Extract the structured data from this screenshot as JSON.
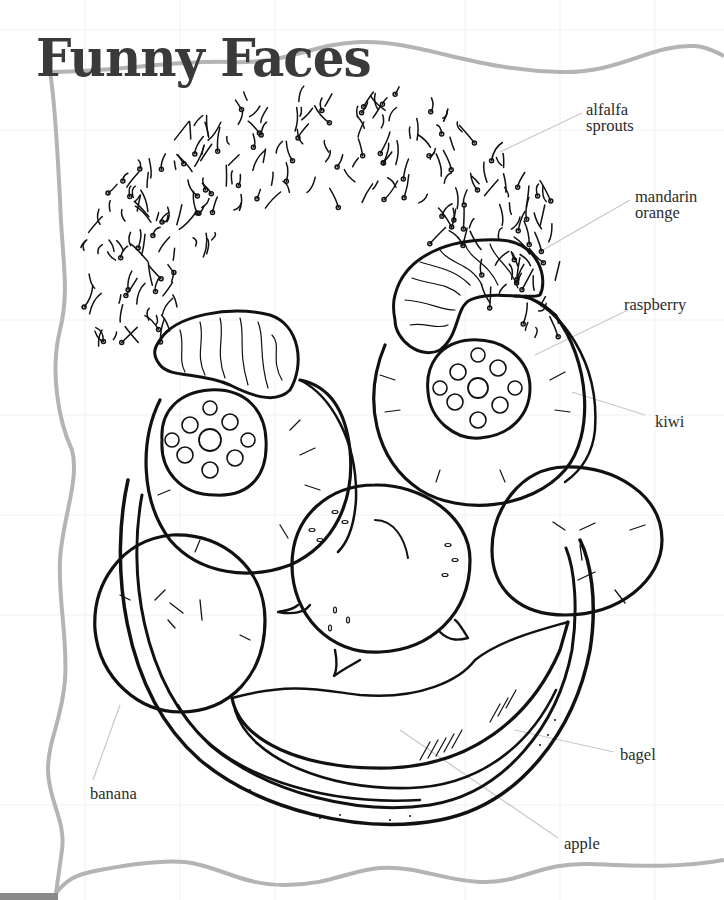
{
  "title": "Funny Faces",
  "colors": {
    "ink": "#111111",
    "frame": "#b4b4b4",
    "title": "#3a3a3a",
    "label": "#2b2b2b",
    "leader": "#c8c8c8",
    "corner_tab": "#8a8a8a"
  },
  "labels": [
    {
      "id": "alfalfa-sprouts",
      "text": "alfalfa\nsprouts",
      "part": "hair"
    },
    {
      "id": "mandarin-orange",
      "text": "mandarin\norange",
      "part": "eyebrows"
    },
    {
      "id": "raspberry",
      "text": "raspberry",
      "part": "pupils"
    },
    {
      "id": "kiwi",
      "text": "kiwi",
      "part": "eyes"
    },
    {
      "id": "bagel",
      "text": "bagel",
      "part": "face"
    },
    {
      "id": "apple",
      "text": "apple",
      "part": "mouth"
    },
    {
      "id": "banana",
      "text": "banana",
      "part": "cheeks"
    }
  ],
  "icons": {
    "hair": "alfalfa-sprouts-icon",
    "eyebrow": "mandarin-segment-icon",
    "eye": "kiwi-slice-icon",
    "pupil": "raspberry-icon",
    "cheek": "banana-slice-icon",
    "nose": "apple-nose-icon",
    "mouth": "apple-wedge-icon",
    "face": "bagel-icon"
  }
}
